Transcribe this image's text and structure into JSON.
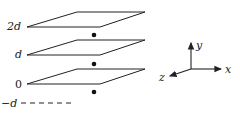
{
  "diagram": {
    "planes": [
      {
        "id": "plane-2d",
        "label": "2d",
        "level": "2d"
      },
      {
        "id": "plane-d",
        "label": "d",
        "level": "d"
      },
      {
        "id": "plane-0",
        "label": "0",
        "level": "0"
      }
    ],
    "dashed_level": {
      "label": "−d"
    },
    "charges": [
      {
        "id": "dot-1",
        "between": "2d and d"
      },
      {
        "id": "dot-2",
        "between": "d and 0"
      },
      {
        "id": "dot-3",
        "between": "0 and −d"
      }
    ],
    "axes": {
      "x": "x",
      "y": "y",
      "z": "z"
    },
    "colors": {
      "line": "#222222",
      "background": "#ffffff"
    }
  }
}
